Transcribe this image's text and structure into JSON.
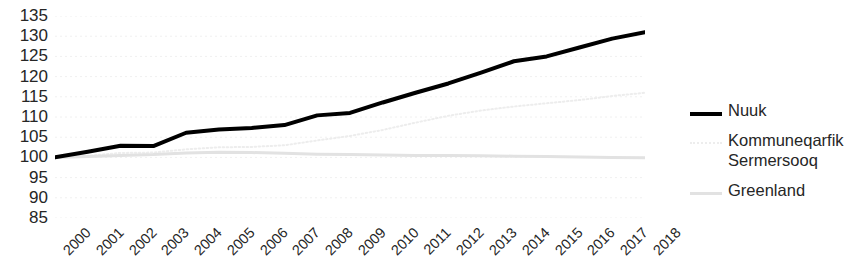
{
  "chart_data": {
    "type": "line",
    "title": "",
    "xlabel": "",
    "ylabel": "",
    "grid": true,
    "legend_position": "right",
    "ylim": [
      85,
      135
    ],
    "yticks": [
      135,
      130,
      125,
      120,
      115,
      110,
      105,
      100,
      95,
      90,
      85
    ],
    "categories": [
      "2000",
      "2001",
      "2002",
      "2003",
      "2004",
      "2005",
      "2006",
      "2007",
      "2008",
      "2009",
      "2010",
      "2011",
      "2012",
      "2013",
      "2014",
      "2015",
      "2016",
      "2017",
      "2018"
    ],
    "series": [
      {
        "name": "Nuuk",
        "color": "#000000",
        "style": "solid",
        "width": 4,
        "values": [
          100.0,
          101.4,
          102.9,
          102.8,
          106.1,
          106.9,
          107.3,
          108.0,
          110.4,
          111.0,
          113.6,
          116.0,
          118.3,
          121.0,
          123.8,
          125.0,
          127.2,
          129.4,
          131.0
        ]
      },
      {
        "name": "Kommuneqarfik Sermersooq",
        "color": "#ededed",
        "style": "dotted",
        "width": 2,
        "values": [
          100.0,
          100.4,
          101.1,
          101.2,
          102.0,
          102.5,
          102.6,
          103.0,
          104.2,
          105.3,
          106.8,
          108.6,
          110.3,
          111.6,
          112.6,
          113.4,
          114.2,
          115.2,
          116.0
        ]
      },
      {
        "name": "Greenland",
        "color": "#e2e2e2",
        "style": "solid",
        "width": 3,
        "values": [
          100.0,
          100.2,
          100.5,
          100.7,
          101.1,
          101.3,
          101.2,
          101.0,
          100.8,
          100.7,
          100.6,
          100.5,
          100.5,
          100.4,
          100.3,
          100.2,
          100.1,
          100.0,
          99.9
        ]
      }
    ]
  },
  "legend": {
    "items": [
      {
        "label": "Nuuk"
      },
      {
        "label": "Kommuneqarfik Sermersooq"
      },
      {
        "label": "Greenland"
      }
    ]
  }
}
